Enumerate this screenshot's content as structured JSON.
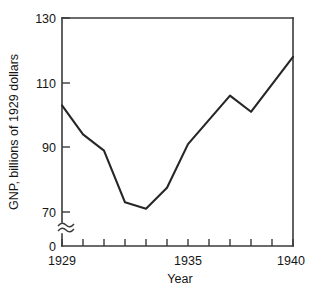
{
  "chart_data": {
    "type": "line",
    "title": "",
    "xlabel": "Year",
    "ylabel": "GNP, billions of 1929 dollars",
    "x": [
      1929,
      1930,
      1931,
      1932,
      1933,
      1934,
      1935,
      1936,
      1937,
      1938,
      1939,
      1940
    ],
    "values": [
      103,
      94,
      89,
      73,
      71,
      77.5,
      91,
      98.5,
      106,
      101,
      109.5,
      118
    ],
    "series": [
      {
        "name": "GNP",
        "values": [
          103,
          94,
          89,
          73,
          71,
          77.5,
          91,
          98.5,
          106,
          101,
          109.5,
          118
        ]
      }
    ],
    "xlim": [
      1929,
      1940
    ],
    "ylim": [
      70,
      130
    ],
    "xticks": [
      1929,
      1930,
      1931,
      1932,
      1933,
      1934,
      1935,
      1936,
      1937,
      1938,
      1939,
      1940
    ],
    "xtick_labels": [
      "1929",
      "",
      "",
      "",
      "",
      "",
      "1935",
      "",
      "",
      "",
      "",
      "1940"
    ],
    "yticks": [
      70,
      90,
      110,
      130
    ],
    "ytick_labels": [
      "70",
      "90",
      "110",
      "130"
    ],
    "y_zero_label": "0",
    "y_axis_break": true,
    "grid": false,
    "legend": false,
    "line_color": "#262626",
    "axis_color": "#3a3a3a",
    "background_color": "#ffffff"
  },
  "axis": {
    "y_labels": [
      "130",
      "110",
      "90",
      "70"
    ],
    "y_zero": "0",
    "x_labels": {
      "start": "1929",
      "middle": "1935",
      "end": "1940"
    },
    "x_title": "Year",
    "y_title": "GNP, billions of 1929 dollars"
  }
}
